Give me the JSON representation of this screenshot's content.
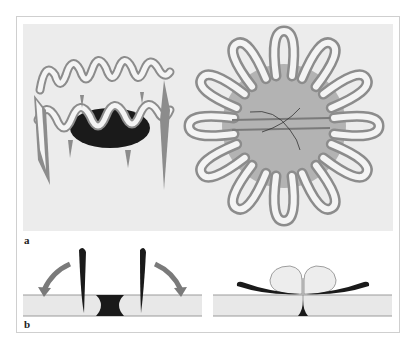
{
  "figure": {
    "panel_a": {
      "label": "a",
      "left_illustration": "ring-of-folded-villi-3d",
      "right_illustration": "star-shaped-folded-membrane-top-view"
    },
    "panel_b": {
      "label": "b",
      "left_illustration": "flaps-opening-with-arrows",
      "right_illustration": "flaps-closed-with-bulbs"
    },
    "colors": {
      "background": "#ffffff",
      "panel_fill": "#ececec",
      "dark_fill": "#1a1a1a",
      "mid_gray": "#8c8c8c",
      "disc_gray": "#a9a9a9",
      "arrow_gray": "#7a7a7a",
      "strip_fill": "#e8e8e8",
      "line_gray": "#9a9a9a"
    }
  }
}
